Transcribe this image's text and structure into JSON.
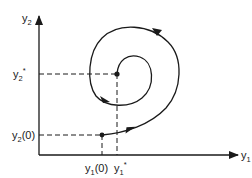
{
  "diagram": {
    "type": "phase-plane-spiral",
    "axes": {
      "x": {
        "label": "y",
        "subscript": "1"
      },
      "y": {
        "label": "y",
        "subscript": "2"
      }
    },
    "equilibrium": {
      "x_label": {
        "base": "y",
        "sub": "1",
        "sup": "*"
      },
      "y_label": {
        "base": "y",
        "sub": "2",
        "sup": "*"
      }
    },
    "initial_point": {
      "x_label": {
        "base": "y",
        "sub": "1",
        "arg": "(0)"
      },
      "y_label": {
        "base": "y",
        "sub": "2",
        "arg": "(0)"
      }
    },
    "trajectory": "spiral converging into equilibrium point",
    "colors": {
      "stroke": "#1a1a1a",
      "background": "#ffffff"
    }
  }
}
